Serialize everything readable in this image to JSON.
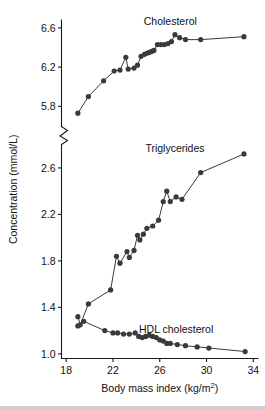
{
  "chart_data": {
    "type": "line",
    "title": "",
    "xlabel": "Body mass index (kg/m2)",
    "xlabel_base": "Body mass index (kg/m",
    "xlabel_exp": "2",
    "xlabel_tail": ")",
    "ylabel": "Concentration (mmol/L)",
    "xlim": [
      17.6,
      34.4
    ],
    "xticks": [
      18,
      22,
      26,
      30,
      34
    ],
    "xticklabels": [
      "18",
      "22",
      "26",
      "30",
      "34"
    ],
    "broken_axis": true,
    "y_upper_lim": [
      5.62,
      6.68
    ],
    "y_upper_ticks": [
      5.8,
      6.2,
      6.6
    ],
    "y_upper_ticklabels": [
      "5.8",
      "6.2",
      "6.6"
    ],
    "y_lower_lim": [
      0.96,
      2.78
    ],
    "y_lower_ticks": [
      1.0,
      1.4,
      1.8,
      2.2,
      2.6
    ],
    "y_lower_ticklabels": [
      "1.0",
      "1.4",
      "1.8",
      "2.2",
      "2.6"
    ],
    "grid": false,
    "legend_position": "inline-annotations",
    "marker": "filled-circle",
    "series": [
      {
        "name": "Cholesterol",
        "label": "Cholesterol",
        "axis": "upper",
        "label_x": 26.9,
        "label_y": 6.63,
        "points": [
          [
            19.0,
            5.73
          ],
          [
            19.9,
            5.9
          ],
          [
            21.2,
            6.06
          ],
          [
            22.1,
            6.16
          ],
          [
            22.6,
            6.17
          ],
          [
            23.1,
            6.3
          ],
          [
            23.3,
            6.18
          ],
          [
            23.8,
            6.19
          ],
          [
            24.1,
            6.22
          ],
          [
            24.4,
            6.31
          ],
          [
            24.7,
            6.33
          ],
          [
            24.9,
            6.34
          ],
          [
            25.1,
            6.35
          ],
          [
            25.3,
            6.36
          ],
          [
            25.5,
            6.37
          ],
          [
            25.8,
            6.43
          ],
          [
            26.1,
            6.43
          ],
          [
            26.4,
            6.43
          ],
          [
            26.7,
            6.44
          ],
          [
            27.0,
            6.46
          ],
          [
            27.3,
            6.53
          ],
          [
            27.7,
            6.5
          ],
          [
            28.2,
            6.48
          ],
          [
            29.5,
            6.48
          ],
          [
            33.2,
            6.51
          ]
        ]
      },
      {
        "name": "Triglycerides",
        "label": "Triglycerides",
        "axis": "lower",
        "label_x": 27.3,
        "label_y": 2.74,
        "points": [
          [
            19.0,
            1.32
          ],
          [
            19.2,
            1.25
          ],
          [
            19.9,
            1.43
          ],
          [
            21.8,
            1.55
          ],
          [
            22.3,
            1.84
          ],
          [
            22.6,
            1.78
          ],
          [
            23.2,
            1.88
          ],
          [
            23.4,
            1.83
          ],
          [
            23.8,
            1.89
          ],
          [
            24.1,
            2.02
          ],
          [
            24.3,
            1.98
          ],
          [
            24.6,
            2.03
          ],
          [
            24.9,
            2.08
          ],
          [
            25.4,
            2.1
          ],
          [
            25.9,
            2.15
          ],
          [
            26.3,
            2.31
          ],
          [
            26.6,
            2.4
          ],
          [
            26.9,
            2.31
          ],
          [
            27.4,
            2.35
          ],
          [
            27.9,
            2.33
          ],
          [
            29.5,
            2.56
          ],
          [
            33.2,
            2.72
          ]
        ]
      },
      {
        "name": "HDL cholesterol",
        "label": "HDL cholesterol",
        "axis": "lower",
        "label_x": 27.4,
        "label_y": 1.18,
        "points": [
          [
            19.0,
            1.24
          ],
          [
            19.5,
            1.28
          ],
          [
            21.3,
            1.2
          ],
          [
            22.0,
            1.18
          ],
          [
            22.4,
            1.18
          ],
          [
            22.9,
            1.17
          ],
          [
            23.4,
            1.17
          ],
          [
            23.9,
            1.18
          ],
          [
            24.2,
            1.15
          ],
          [
            24.5,
            1.14
          ],
          [
            24.8,
            1.15
          ],
          [
            25.1,
            1.16
          ],
          [
            25.4,
            1.15
          ],
          [
            25.7,
            1.14
          ],
          [
            26.0,
            1.12
          ],
          [
            26.3,
            1.11
          ],
          [
            26.6,
            1.09
          ],
          [
            26.9,
            1.09
          ],
          [
            27.5,
            1.08
          ],
          [
            28.2,
            1.07
          ],
          [
            29.2,
            1.06
          ],
          [
            30.2,
            1.05
          ],
          [
            33.3,
            1.02
          ]
        ]
      }
    ]
  }
}
